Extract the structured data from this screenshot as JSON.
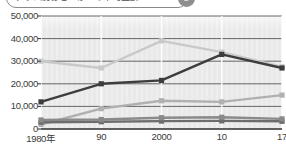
{
  "header": {
    "title_text": "クラス別おこづかいの平均金額",
    "badge_label": "2"
  },
  "chart_data": {
    "type": "line",
    "title": "",
    "xlabel": "",
    "ylabel": "",
    "ylim": [
      0,
      50000
    ],
    "grid": true,
    "legend_position": "none",
    "categories": [
      "1980年",
      "90",
      "2000",
      "10",
      "17"
    ],
    "y_ticks": [
      "0",
      "10,000",
      "20,000",
      "30,000",
      "40,000",
      "50,000"
    ],
    "y_tick_values": [
      0,
      10000,
      20000,
      30000,
      40000,
      50000
    ],
    "series": [
      {
        "name": "series-dark",
        "color": "#3d3d3d",
        "values": [
          12000,
          20000,
          21500,
          33000,
          27000
        ]
      },
      {
        "name": "series-light-gray",
        "color": "#c9c9c9",
        "values": [
          30000,
          27000,
          39000,
          34000,
          27500
        ]
      },
      {
        "name": "series-mid-gray",
        "color": "#b0b0b0",
        "values": [
          2000,
          9000,
          12500,
          12000,
          15000
        ]
      },
      {
        "name": "series-dark-gray",
        "color": "#8a8a8a",
        "values": [
          4000,
          4200,
          5000,
          5200,
          4500
        ]
      },
      {
        "name": "series-bottom-gray",
        "color": "#6d6d6d",
        "values": [
          3000,
          3200,
          3500,
          3600,
          3400
        ]
      }
    ]
  }
}
